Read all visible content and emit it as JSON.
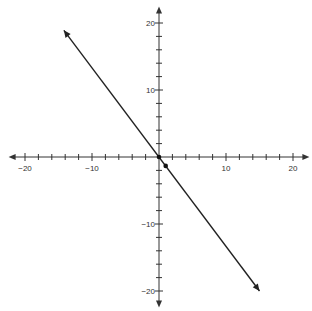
{
  "chart_data": {
    "type": "line",
    "title": "",
    "xlabel": "",
    "ylabel": "",
    "xlim": [
      -20,
      20
    ],
    "ylim": [
      -20,
      20
    ],
    "grid": false,
    "x_tick_labels": [
      "-20",
      "-10",
      "10",
      "20"
    ],
    "y_tick_labels": [
      "20",
      "10",
      "-10",
      "-20"
    ],
    "minor_tick_step": 2,
    "series": [
      {
        "name": "line",
        "equation": "y = -4/3 x",
        "x": [
          -14.2,
          15
        ],
        "y": [
          18.9,
          -20
        ],
        "arrows_both_ends": true,
        "color": "#222222"
      }
    ],
    "points": [
      {
        "x": 0,
        "y": 0
      },
      {
        "x": 1,
        "y": -1.33
      }
    ]
  },
  "colors": {
    "axis": "#333333",
    "line": "#222222",
    "background": "#ffffff"
  }
}
